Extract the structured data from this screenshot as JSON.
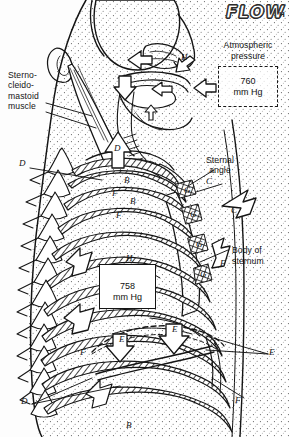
{
  "figure": {
    "title_word": "FLOW",
    "title_suffix": "H",
    "type": "anatomical-illustration"
  },
  "atmospheric": {
    "label_line1": "Atmospheric",
    "label_line2": "pressure",
    "value": "760",
    "unit": "mm Hg"
  },
  "intrapulmonary": {
    "value": "758",
    "unit": "mm Hg",
    "marker": "H"
  },
  "labels": {
    "sternocleidomastoid": "Sterno-\ncleido-\nmastoid\nmuscle",
    "sternal_angle_line1": "Sternal",
    "sternal_angle_line2": "angle",
    "body_of_sternum_line1": "Body of",
    "body_of_sternum_line2": "sternum"
  },
  "markers": {
    "airflow_head": "H",
    "sternal_angle": "C",
    "sternum_arrow": "C",
    "rib_elevation": "D",
    "vertebra_upper": "D",
    "vertebra_lower": "D",
    "diaphragm_right": "E",
    "diaphragm_arrow_left": "E",
    "diaphragm_arrow_right": "E",
    "intercostal_upper": "B",
    "intercostal_mid": "B",
    "intercostal_lower": "B",
    "rib_upper": "F",
    "rib_mid": "F",
    "rib_right_upper": "F",
    "rib_lower_left": "F",
    "rib_bottom_right": "F",
    "costal_cartilage_1": "G",
    "costal_cartilage_2": "G",
    "costal_cartilage_3": "G",
    "costal_cartilage_4": "G"
  }
}
